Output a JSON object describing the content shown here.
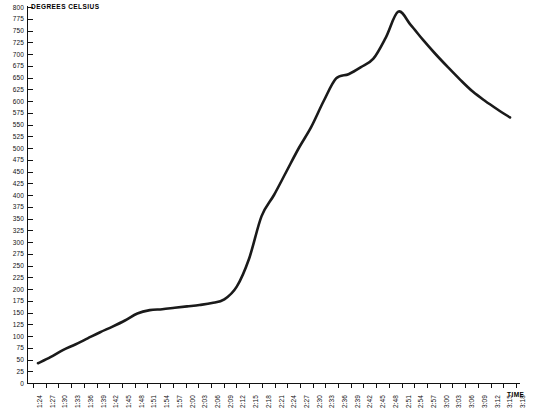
{
  "chart_data": {
    "type": "line",
    "title": "",
    "ylabel": "DEGREES CELSIUS",
    "xlabel": "TIME",
    "ylim": [
      0,
      800
    ],
    "ytick_step": 25,
    "grid": false,
    "legend": null,
    "yticks": [
      0,
      25,
      50,
      75,
      100,
      125,
      150,
      175,
      200,
      225,
      250,
      275,
      300,
      325,
      350,
      375,
      400,
      425,
      450,
      475,
      500,
      525,
      550,
      575,
      600,
      625,
      650,
      675,
      700,
      725,
      750,
      775,
      800
    ],
    "categories": [
      "1:24",
      "1:27",
      "1:30",
      "1:33",
      "1:36",
      "1:39",
      "1:42",
      "1:45",
      "1:48",
      "1:51",
      "1:54",
      "1:57",
      "2:00",
      "2:03",
      "2:06",
      "2:09",
      "2:12",
      "2:15",
      "2:18",
      "2:21",
      "2:24",
      "2:27",
      "2:30",
      "2:33",
      "2:36",
      "2:39",
      "2:42",
      "2:45",
      "2:48",
      "2:51",
      "2:54",
      "2:57",
      "3:00",
      "3:03",
      "3:06",
      "3:09",
      "3:12",
      "3:15",
      "3:18"
    ],
    "values": [
      42,
      55,
      70,
      82,
      95,
      108,
      120,
      133,
      148,
      155,
      157,
      160,
      163,
      166,
      170,
      178,
      205,
      265,
      355,
      400,
      450,
      500,
      545,
      600,
      648,
      657,
      672,
      690,
      735,
      790,
      762,
      730,
      700,
      672,
      645,
      620,
      600,
      582,
      565
    ],
    "series": [
      {
        "name": "Degrees Celsius",
        "color": "#1a1a1a",
        "values": [
          42,
          55,
          70,
          82,
          95,
          108,
          120,
          133,
          148,
          155,
          157,
          160,
          163,
          166,
          170,
          178,
          205,
          265,
          355,
          400,
          450,
          500,
          545,
          600,
          648,
          657,
          672,
          690,
          735,
          790,
          762,
          730,
          700,
          672,
          645,
          620,
          600,
          582,
          565
        ]
      }
    ],
    "annotations": [
      {
        "label": "plateau",
        "x": "1:51",
        "y": 155
      },
      {
        "label": "steep-rise-start",
        "x": "2:09",
        "y": 178
      },
      {
        "label": "shoulder",
        "x": "2:39",
        "y": 657
      },
      {
        "label": "peak",
        "x": "2:51",
        "y": 790
      },
      {
        "label": "end",
        "x": "3:18",
        "y": 565
      }
    ]
  },
  "axes": {
    "y_title": "DEGREES CELSIUS",
    "x_title": "TIME"
  }
}
